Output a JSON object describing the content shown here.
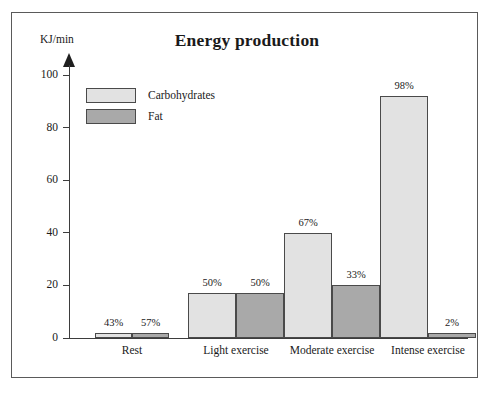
{
  "chart_data": {
    "type": "bar",
    "title": "Energy production",
    "xlabel": "",
    "ylabel": "KJ/min",
    "ylim": [
      0,
      100
    ],
    "yticks": [
      0,
      20,
      40,
      60,
      80,
      100
    ],
    "grid": false,
    "legend_position": "upper-left-inside",
    "categories": [
      "Rest",
      "Light exercise",
      "Moderate exercise",
      "Intense exercise"
    ],
    "series": [
      {
        "name": "Carbohydrates",
        "color": "#e2e2e2",
        "values": [
          2,
          17,
          40,
          92
        ],
        "labels": [
          "43%",
          "50%",
          "67%",
          "98%"
        ]
      },
      {
        "name": "Fat",
        "color": "#a9a9a9",
        "values": [
          2,
          17,
          20,
          2
        ],
        "labels": [
          "57%",
          "50%",
          "33%",
          "2%"
        ]
      }
    ]
  },
  "colors": {
    "carbohydrates": "#e2e2e2",
    "fat": "#a9a9a9",
    "axis": "#3d3d3d",
    "frame": "#5a5a5a",
    "text": "#1a1a1a"
  }
}
